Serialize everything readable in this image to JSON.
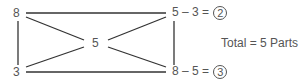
{
  "diagram": {
    "corners": {
      "top_left": "8",
      "bottom_left": "3",
      "center": "5"
    },
    "equations": {
      "top_right": {
        "expr": "5 – 3 =",
        "result": "2"
      },
      "bottom_right": {
        "expr": "8 – 5 =",
        "result": "3"
      }
    },
    "total": "Total = 5 Parts",
    "line_color": "#333333",
    "text_color": "#555555"
  }
}
